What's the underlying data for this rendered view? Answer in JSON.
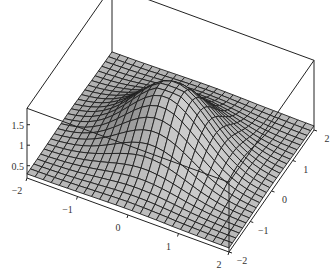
{
  "chart_data": {
    "type": "surface3d",
    "title": "",
    "xlabel": "",
    "ylabel": "",
    "zlabel": "",
    "x_range": [
      -2,
      2
    ],
    "y_range": [
      -2,
      2
    ],
    "z_range": [
      0.2,
      1.9
    ],
    "grid_resolution": 25,
    "x_ticks": [
      -2,
      -1,
      0,
      1,
      2
    ],
    "x_tick_labels": [
      "-2",
      "-1",
      "0",
      "1",
      "2"
    ],
    "y_ticks": [
      -2,
      -1,
      0,
      1,
      2
    ],
    "y_tick_labels": [
      "-2",
      "-1",
      "0",
      "1",
      "2"
    ],
    "z_ticks": [
      0.5,
      1,
      1.5
    ],
    "z_tick_labels": [
      "0.5",
      "1",
      "1.5"
    ],
    "surface_description": "Central peak (~1.8) near origin with flattened plateau top, decaying to ~0.3 at corners; box frame drawn, mesh grid lines",
    "colors": {
      "surface": "#a4a4a4",
      "surface_light": "#d6d6d6",
      "mesh": "#1e1e1e",
      "box": "#222222"
    },
    "projection": {
      "origin_corner_px": [
        27,
        178
      ],
      "x_corner_px": [
        229,
        252
      ],
      "xy_corner_px": [
        314,
        130
      ],
      "z_px_per_unit": 41
    }
  }
}
